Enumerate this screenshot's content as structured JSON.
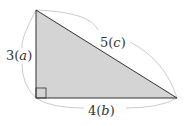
{
  "diagram": {
    "type": "right-triangle",
    "fill_color": "#d4d4d4",
    "stroke_color": "#333333",
    "brace_color": "#cccccc",
    "vertices": {
      "top": [
        36,
        10
      ],
      "right_angle": [
        36,
        98
      ],
      "right": [
        177,
        98
      ]
    },
    "sides": {
      "a": {
        "number": "3",
        "variable": "a",
        "label": "3(a)"
      },
      "b": {
        "number": "4",
        "variable": "b",
        "label": "4(b)"
      },
      "c": {
        "number": "5",
        "variable": "c",
        "label": "5(c)"
      }
    },
    "right_angle_marker": true
  }
}
